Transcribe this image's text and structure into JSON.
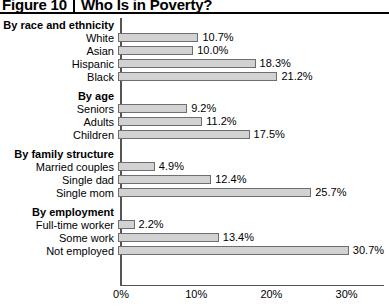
{
  "header": {
    "figure_number": "Figure 10",
    "title": "Who Is in Poverty?"
  },
  "chart_data": {
    "type": "bar",
    "orientation": "horizontal",
    "title": "Who Is in Poverty?",
    "xlabel": "",
    "ylabel": "",
    "xlim": [
      0,
      35
    ],
    "grid": false,
    "legend": null,
    "xticks": [
      "0%",
      "10%",
      "20%",
      "30%"
    ],
    "xtick_values": [
      0,
      10,
      20,
      30
    ],
    "value_suffix": "%",
    "groups": [
      {
        "name": "By race and ethnicity",
        "categories": [
          "White",
          "Asian",
          "Hispanic",
          "Black"
        ],
        "values": [
          10.7,
          10.0,
          18.3,
          21.2
        ],
        "labels": [
          "10.7%",
          "10.0%",
          "18.3%",
          "21.2%"
        ]
      },
      {
        "name": "By age",
        "categories": [
          "Seniors",
          "Adults",
          "Children"
        ],
        "values": [
          9.2,
          11.2,
          17.5
        ],
        "labels": [
          "9.2%",
          "11.2%",
          "17.5%"
        ]
      },
      {
        "name": "By family structure",
        "categories": [
          "Married couples",
          "Single dad",
          "Single mom"
        ],
        "values": [
          4.9,
          12.4,
          25.7
        ],
        "labels": [
          "4.9%",
          "12.4%",
          "25.7%"
        ]
      },
      {
        "name": "By employment",
        "categories": [
          "Full-time worker",
          "Some work",
          "Not employed"
        ],
        "values": [
          2.2,
          13.4,
          30.7
        ],
        "labels": [
          "2.2%",
          "13.4%",
          "30.7%"
        ]
      }
    ]
  },
  "colors": {
    "bar_fill": "#d2d2d2",
    "bar_border": "#6e6e6e",
    "axis": "#555555",
    "text": "#000000",
    "background": "#ffffff"
  }
}
